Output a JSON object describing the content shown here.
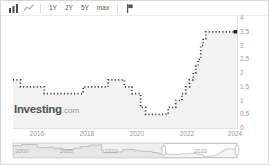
{
  "toolbar": {
    "chart_type_icons": [
      "candlestick-chart-icon",
      "line-chart-icon"
    ],
    "range_buttons": [
      "1Y",
      "2Y",
      "5Y",
      "max"
    ],
    "right_icon": "flag-icon"
  },
  "watermark": {
    "brand": "Investing",
    "suffix": ".com"
  },
  "chart_data": {
    "type": "line",
    "step": true,
    "title": "",
    "xlabel": "",
    "ylabel": "",
    "legend": "none",
    "grid": false,
    "xlim": [
      2015.05,
      2024.0
    ],
    "ylim": [
      0,
      4
    ],
    "x_ticks": [
      "2016",
      "2018",
      "2020",
      "2022",
      "2024"
    ],
    "y_ticks": [
      "0",
      "0.5",
      "1",
      "1.5",
      "2",
      "2.5",
      "3",
      "3.5",
      "4"
    ],
    "last_value_marker": "3.5",
    "line_color": "#3a3a3a",
    "area_fill": "rgba(0,0,0,0.05)",
    "axis_label_color": "#999999",
    "series": [
      {
        "name": "interest-rate-percent",
        "points": [
          [
            2015.05,
            1.75
          ],
          [
            2015.35,
            1.5
          ],
          [
            2016.3,
            1.25
          ],
          [
            2017.85,
            1.5
          ],
          [
            2018.85,
            1.75
          ],
          [
            2019.5,
            1.5
          ],
          [
            2019.8,
            1.25
          ],
          [
            2020.15,
            0.75
          ],
          [
            2020.35,
            0.5
          ],
          [
            2021.25,
            0.75
          ],
          [
            2021.55,
            1.0
          ],
          [
            2021.8,
            1.25
          ],
          [
            2021.95,
            1.5
          ],
          [
            2022.1,
            1.75
          ],
          [
            2022.25,
            2.0
          ],
          [
            2022.35,
            2.25
          ],
          [
            2022.45,
            2.5
          ],
          [
            2022.55,
            3.0
          ],
          [
            2022.65,
            3.25
          ],
          [
            2022.75,
            3.5
          ],
          [
            2024.0,
            3.5
          ]
        ]
      }
    ]
  },
  "navigator": {
    "labels": [
      "2000",
      "2005",
      "2010",
      "2020"
    ],
    "xlim": [
      1999.0,
      2024.1
    ],
    "ylim": [
      0,
      5.5
    ],
    "window_years": [
      2015.9,
      2024.1
    ],
    "series_points": [
      [
        1999.0,
        4.75
      ],
      [
        2000.0,
        5.25
      ],
      [
        2001.7,
        4.0
      ],
      [
        2003.0,
        4.25
      ],
      [
        2003.6,
        3.75
      ],
      [
        2004.6,
        3.25
      ],
      [
        2005.8,
        3.75
      ],
      [
        2006.6,
        4.5
      ],
      [
        2007.6,
        5.0
      ],
      [
        2008.6,
        5.25
      ],
      [
        2008.9,
        3.0
      ],
      [
        2009.1,
        2.0
      ],
      [
        2010.6,
        2.25
      ],
      [
        2011.2,
        3.0
      ],
      [
        2011.5,
        3.25
      ],
      [
        2012.6,
        2.75
      ],
      [
        2013.4,
        2.5
      ],
      [
        2014.6,
        2.0
      ],
      [
        2015.2,
        1.75
      ],
      [
        2015.45,
        1.5
      ],
      [
        2016.45,
        1.25
      ],
      [
        2017.9,
        1.5
      ],
      [
        2018.9,
        1.75
      ],
      [
        2019.55,
        1.5
      ],
      [
        2019.8,
        1.25
      ],
      [
        2020.2,
        0.75
      ],
      [
        2020.4,
        0.5
      ],
      [
        2021.3,
        0.75
      ],
      [
        2021.6,
        1.0
      ],
      [
        2021.85,
        1.25
      ],
      [
        2022.0,
        1.5
      ],
      [
        2022.1,
        1.75
      ],
      [
        2022.25,
        2.25
      ],
      [
        2022.45,
        2.5
      ],
      [
        2022.55,
        3.0
      ],
      [
        2022.7,
        3.25
      ],
      [
        2022.85,
        3.5
      ],
      [
        2024.1,
        3.5
      ]
    ]
  }
}
